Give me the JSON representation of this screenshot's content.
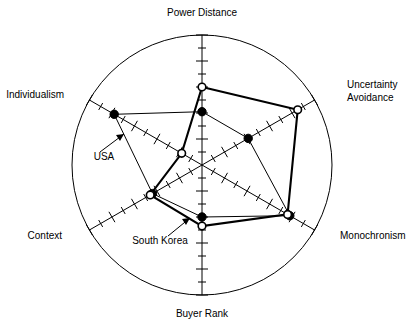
{
  "figure": {
    "title": "",
    "background_color": "#ffffff",
    "line_color": "#000000",
    "width": 407,
    "height": 328
  },
  "chart_data": {
    "type": "radar",
    "title": "",
    "subtitle": "",
    "xlabel": "",
    "ylabel": "",
    "grid": true,
    "legend_position": "annotated-inline",
    "center": {
      "x": 202,
      "y": 165
    },
    "radius": 130,
    "rmin": 0,
    "rmax": 1,
    "tick_count": 10,
    "categories": [
      "Power Distance",
      "Uncertainty Avoidance",
      "Monochronism",
      "Buyer Rank",
      "Context",
      "Individualism"
    ],
    "category_angles_deg": [
      90,
      30,
      -30,
      -90,
      -150,
      150
    ],
    "series": [
      {
        "name": "USA",
        "marker": "filled-circle",
        "line_weight": "thin",
        "values": [
          0.41,
          0.41,
          0.78,
          0.4,
          0.44,
          0.78
        ]
      },
      {
        "name": "South Korea",
        "marker": "open-circle",
        "line_weight": "thick",
        "values": [
          0.6,
          0.85,
          0.76,
          0.47,
          0.46,
          0.18
        ]
      }
    ],
    "annotations": [
      {
        "label": "USA",
        "x": 105,
        "y": 156
      },
      {
        "label": "South Korea",
        "x": 123,
        "y": 240
      }
    ]
  },
  "axis_labels": [
    {
      "text": "Power Distance",
      "x": 202,
      "y": 16,
      "anchor": "middle"
    },
    {
      "text": "Uncertainty",
      "x": 347,
      "y": 88,
      "anchor": "start"
    },
    {
      "text": "Avoidance",
      "x": 347,
      "y": 101,
      "anchor": "start"
    },
    {
      "text": "Monochronism",
      "x": 340,
      "y": 239,
      "anchor": "start"
    },
    {
      "text": "Buyer Rank",
      "x": 202,
      "y": 317,
      "anchor": "middle"
    },
    {
      "text": "Context",
      "x": 62,
      "y": 239,
      "anchor": "end"
    },
    {
      "text": "Individualism",
      "x": 64,
      "y": 98,
      "anchor": "end"
    }
  ],
  "series_labels": [
    {
      "text": "USA",
      "x": 104,
      "y": 160,
      "anchor": "middle"
    },
    {
      "text": "South Korea",
      "x": 160,
      "y": 244,
      "anchor": "middle"
    }
  ]
}
